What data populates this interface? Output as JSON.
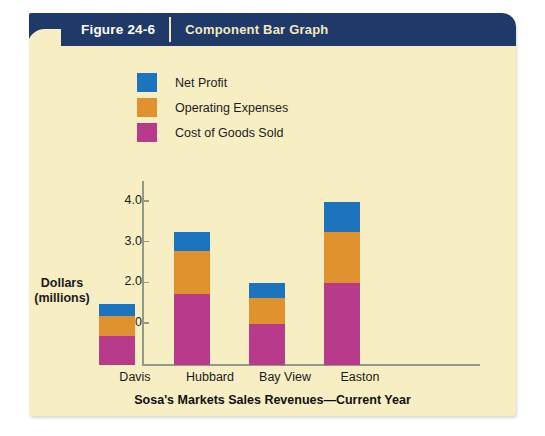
{
  "header": {
    "figure_number": "Figure 24-6",
    "title": "Component Bar Graph"
  },
  "colors": {
    "net_profit": "#1b74bd",
    "operating_expenses": "#e0922f",
    "cost_of_goods_sold": "#b83a8a",
    "card_background": "#f7eec4",
    "header_background": "#1f3a68",
    "axis": "#8d9c88"
  },
  "axis_label": {
    "line1": "Dollars",
    "line2": "(millions)"
  },
  "chart_data": {
    "type": "bar",
    "stacked": true,
    "title": "Sosa's Markets Sales Revenues—Current Year",
    "xlabel": "",
    "ylabel": "Dollars (millions)",
    "ylim": [
      0,
      4.5
    ],
    "yticks": [
      1.0,
      2.0,
      3.0,
      4.0
    ],
    "ytick_labels": [
      "1.0",
      "2.0",
      "3.0",
      "4.0"
    ],
    "grid": false,
    "legend_position": "top-left",
    "categories": [
      "Davis",
      "Hubbard",
      "Bay View",
      "Easton"
    ],
    "series": [
      {
        "name": "Cost of Goods Sold",
        "color": "#b83a8a",
        "values": [
          0.7,
          1.75,
          1.0,
          2.0
        ]
      },
      {
        "name": "Operating Expenses",
        "color": "#e0922f",
        "values": [
          0.5,
          1.05,
          0.65,
          1.25
        ]
      },
      {
        "name": "Net Profit",
        "color": "#1b74bd",
        "values": [
          0.3,
          0.45,
          0.35,
          0.75
        ]
      }
    ],
    "totals": [
      1.5,
      3.25,
      2.0,
      4.0
    ]
  }
}
